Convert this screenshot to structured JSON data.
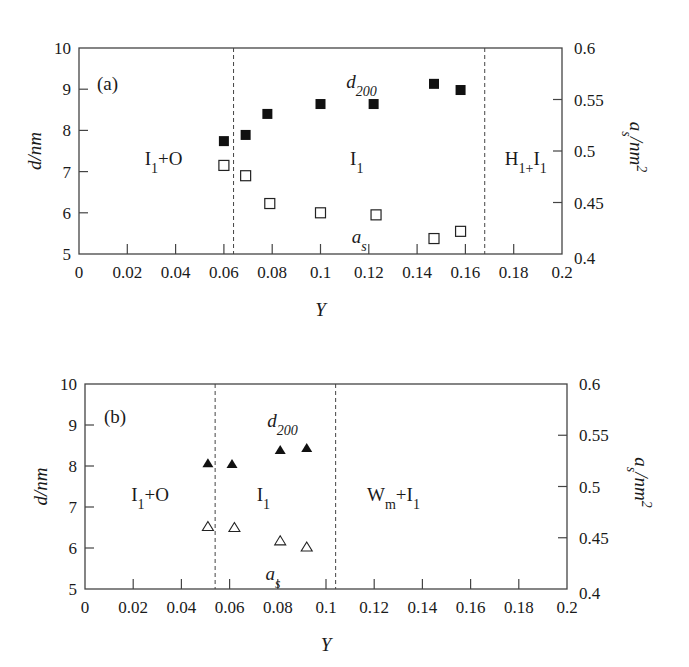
{
  "chart_data": [
    {
      "type": "scatter",
      "panel": "(a)",
      "xlabel": "Y",
      "ylabel": "d/nm",
      "y2label": "a_s/nm^2",
      "xlim": [
        0,
        0.2
      ],
      "ylim": [
        5,
        10
      ],
      "y2lim": [
        0.4,
        0.6
      ],
      "xticks": [
        "0",
        "0.02",
        "0.04",
        "0.06",
        "0.08",
        "0.1",
        "0.12",
        "0.14",
        "0.16",
        "0.18",
        "0.2"
      ],
      "yticks": [
        "5",
        "6",
        "7",
        "8",
        "9",
        "10"
      ],
      "y2ticks": [
        "0.4",
        "0.45",
        "0.5",
        "0.55",
        "0.6"
      ],
      "grid": false,
      "phase_boundaries": [
        0.064,
        0.168
      ],
      "regions": [
        {
          "label_main": "I",
          "label_sub": "1",
          "label_rest": "+O",
          "x": 0.035
        },
        {
          "label_main": "I",
          "label_sub": "1",
          "label_rest": "",
          "x": 0.115
        },
        {
          "label_main": "H",
          "label_sub": "1+",
          "label_rest": "I",
          "label_sub2": "1",
          "x": 0.185
        }
      ],
      "series": [
        {
          "name": "d200",
          "label_main": "d",
          "label_sub": "200",
          "axis": "left",
          "marker": "filled-square",
          "x": [
            0.06,
            0.069,
            0.078,
            0.1,
            0.122,
            0.147,
            0.158
          ],
          "values": [
            7.74,
            7.89,
            8.4,
            8.64,
            8.64,
            9.13,
            8.98
          ]
        },
        {
          "name": "as",
          "label_main": "a",
          "label_sub": "s",
          "axis": "right",
          "marker": "hollow-square",
          "x": [
            0.06,
            0.069,
            0.079,
            0.1,
            0.123,
            0.147,
            0.158
          ],
          "values": [
            0.486,
            0.476,
            0.449,
            0.44,
            0.438,
            0.415,
            0.422
          ]
        }
      ]
    },
    {
      "type": "scatter",
      "panel": "(b)",
      "xlabel": "Y",
      "ylabel": "d/nm",
      "y2label": "a_s/nm^2",
      "xlim": [
        0,
        0.2
      ],
      "ylim": [
        5,
        10
      ],
      "y2lim": [
        0.4,
        0.6
      ],
      "xticks": [
        "0",
        "0.02",
        "0.04",
        "0.06",
        "0.08",
        "0.1",
        "0.12",
        "0.14",
        "0.16",
        "0.18",
        "0.2"
      ],
      "yticks": [
        "5",
        "6",
        "7",
        "8",
        "9",
        "10"
      ],
      "y2ticks": [
        "0.4",
        "0.45",
        "0.5",
        "0.55",
        "0.6"
      ],
      "grid": false,
      "phase_boundaries": [
        0.054,
        0.104
      ],
      "regions": [
        {
          "label_main": "I",
          "label_sub": "1",
          "label_rest": "+O",
          "x": 0.027
        },
        {
          "label_main": "I",
          "label_sub": "1",
          "label_rest": "",
          "x": 0.074
        },
        {
          "label_main": "W",
          "label_sub": "m",
          "label_rest": "+I",
          "label_sub2": "1",
          "x": 0.128
        }
      ],
      "series": [
        {
          "name": "d200",
          "label_main": "d",
          "label_sub": "200",
          "axis": "left",
          "marker": "filled-triangle",
          "x": [
            0.051,
            0.061,
            0.081,
            0.092
          ],
          "values": [
            8.07,
            8.05,
            8.39,
            8.44
          ]
        },
        {
          "name": "as",
          "label_main": "a",
          "label_sub": "s",
          "axis": "right",
          "marker": "hollow-triangle",
          "x": [
            0.051,
            0.062,
            0.081,
            0.092
          ],
          "values": [
            0.461,
            0.46,
            0.447,
            0.441
          ]
        }
      ]
    }
  ]
}
